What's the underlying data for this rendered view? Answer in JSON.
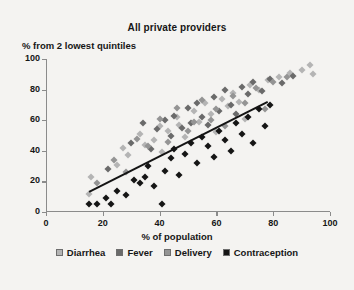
{
  "chart_data": {
    "type": "scatter",
    "title": "All private providers",
    "xlabel": "% of population",
    "ylabel": "% from 2 lowest quintiles",
    "xlim": [
      0,
      100
    ],
    "ylim": [
      0,
      100
    ],
    "xticks": [
      0,
      20,
      40,
      60,
      80,
      100
    ],
    "yticks": [
      0,
      20,
      40,
      60,
      80,
      100
    ],
    "grid": false,
    "legend_position": "bottom",
    "colors": {
      "diarrhea": "#b4b4b4",
      "fever": "#6a6a6a",
      "delivery": "#949494",
      "contraception": "#151515",
      "trendline": "#141414",
      "axis": "#8b8b8b",
      "background": "#f4f3f1"
    },
    "trendline": {
      "label": "linear fit",
      "x0": 15,
      "y0": 14,
      "x1": 78,
      "y1": 73
    },
    "series": [
      {
        "name": "Diarrhea",
        "color": "#b4b4b4",
        "points": [
          [
            16,
            23
          ],
          [
            15,
            12
          ],
          [
            25,
            31
          ],
          [
            27,
            42
          ],
          [
            29,
            37
          ],
          [
            33,
            51
          ],
          [
            35,
            44
          ],
          [
            38,
            47
          ],
          [
            40,
            56
          ],
          [
            41,
            39
          ],
          [
            43,
            53
          ],
          [
            46,
            62
          ],
          [
            47,
            57
          ],
          [
            49,
            49
          ],
          [
            52,
            66
          ],
          [
            54,
            59
          ],
          [
            56,
            71
          ],
          [
            58,
            64
          ],
          [
            60,
            52
          ],
          [
            62,
            74
          ],
          [
            64,
            69
          ],
          [
            66,
            78
          ],
          [
            68,
            72
          ],
          [
            70,
            61
          ],
          [
            72,
            83
          ],
          [
            75,
            80
          ],
          [
            78,
            86
          ],
          [
            82,
            88
          ],
          [
            86,
            91
          ],
          [
            90,
            93
          ],
          [
            93,
            96
          ],
          [
            94,
            90
          ]
        ]
      },
      {
        "name": "Fever",
        "color": "#6a6a6a",
        "points": [
          [
            22,
            28
          ],
          [
            30,
            45
          ],
          [
            34,
            58
          ],
          [
            37,
            41
          ],
          [
            39,
            54
          ],
          [
            42,
            60
          ],
          [
            44,
            50
          ],
          [
            45,
            63
          ],
          [
            48,
            55
          ],
          [
            50,
            68
          ],
          [
            51,
            58
          ],
          [
            53,
            71
          ],
          [
            55,
            62
          ],
          [
            57,
            57
          ],
          [
            59,
            75
          ],
          [
            61,
            66
          ],
          [
            63,
            80
          ],
          [
            65,
            70
          ],
          [
            67,
            64
          ],
          [
            69,
            82
          ],
          [
            71,
            77
          ],
          [
            73,
            85
          ],
          [
            76,
            79
          ],
          [
            79,
            87
          ],
          [
            83,
            84
          ],
          [
            87,
            89
          ]
        ]
      },
      {
        "name": "Delivery",
        "color": "#949494",
        "points": [
          [
            18,
            19
          ],
          [
            24,
            34
          ],
          [
            28,
            26
          ],
          [
            32,
            48
          ],
          [
            36,
            43
          ],
          [
            40,
            61
          ],
          [
            43,
            46
          ],
          [
            46,
            68
          ],
          [
            50,
            53
          ],
          [
            52,
            59
          ],
          [
            55,
            73
          ],
          [
            58,
            60
          ],
          [
            60,
            67
          ],
          [
            63,
            56
          ],
          [
            66,
            76
          ],
          [
            70,
            71
          ],
          [
            74,
            81
          ],
          [
            77,
            67
          ],
          [
            80,
            85
          ],
          [
            85,
            88
          ]
        ]
      },
      {
        "name": "Contraception",
        "color": "#151515",
        "points": [
          [
            15,
            5
          ],
          [
            18,
            5
          ],
          [
            21,
            9
          ],
          [
            23,
            5
          ],
          [
            25,
            14
          ],
          [
            28,
            11
          ],
          [
            31,
            21
          ],
          [
            33,
            19
          ],
          [
            35,
            23
          ],
          [
            36,
            30
          ],
          [
            38,
            17
          ],
          [
            41,
            5
          ],
          [
            42,
            27
          ],
          [
            44,
            35
          ],
          [
            45,
            41
          ],
          [
            47,
            24
          ],
          [
            49,
            38
          ],
          [
            51,
            45
          ],
          [
            53,
            32
          ],
          [
            55,
            49
          ],
          [
            57,
            43
          ],
          [
            59,
            36
          ],
          [
            61,
            53
          ],
          [
            63,
            47
          ],
          [
            65,
            40
          ],
          [
            67,
            58
          ],
          [
            69,
            51
          ],
          [
            71,
            62
          ],
          [
            73,
            45
          ],
          [
            75,
            67
          ],
          [
            77,
            56
          ],
          [
            79,
            70
          ]
        ]
      }
    ]
  },
  "legend": {
    "items": [
      {
        "label": "Diarrhea",
        "color": "#b4b4b4"
      },
      {
        "label": "Fever",
        "color": "#6a6a6a"
      },
      {
        "label": "Delivery",
        "color": "#949494"
      },
      {
        "label": "Contraception",
        "color": "#151515"
      }
    ]
  }
}
